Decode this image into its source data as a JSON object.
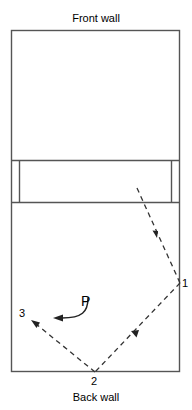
{
  "figure": {
    "stroke_color": "#555555",
    "ray_color": "#333333",
    "background": "#ffffff"
  },
  "labels": {
    "front_wall": "Front wall",
    "back_wall": "Back wall",
    "point_1": "1",
    "point_2": "2",
    "point_3": "3",
    "point_p": "P"
  },
  "geometry": {
    "room": {
      "x": 11,
      "y": 30,
      "width": 169,
      "height": 342
    },
    "band": {
      "top_y": 160,
      "bottom_y": 202,
      "inner_left_x": 19,
      "inner_right_x": 171
    },
    "ray_points": {
      "start": {
        "x": 137,
        "y": 188
      },
      "p1": {
        "x": 180,
        "y": 283
      },
      "p2": {
        "x": 95,
        "y": 372
      },
      "p3": {
        "x": 33,
        "y": 322
      }
    },
    "p_arrow": {
      "start_x": 88,
      "start_y": 300,
      "end_x": 55,
      "end_y": 318
    }
  }
}
